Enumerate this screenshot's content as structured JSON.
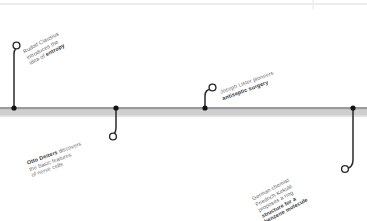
{
  "figure": {
    "kind": "horizontal-timeline",
    "orientation": "horizontal",
    "background_color": "#ffffff",
    "axis": {
      "bar_color": "#c9c9cb",
      "bar_top_edge_color": "#8e8e92",
      "bar_bottom_edge_color": "#e2e2e4",
      "marker_color": "#1c1c1e",
      "connector_color": "#2a2a2c"
    },
    "top_rule_color": "#e6e6e8"
  },
  "events": [
    {
      "id": "clausius",
      "position": "above",
      "marker_x": 14,
      "label_lines": [
        {
          "text": "Rudolf Clausius",
          "bold": false
        },
        {
          "text": "introduces the",
          "bold": false
        },
        {
          "text": "idea of ",
          "bold": false,
          "bold_tail": "entropy"
        }
      ],
      "plain_text": "Rudolf Clausius introduces the idea of entropy",
      "highlight_term": "entropy"
    },
    {
      "id": "deiters",
      "position": "below",
      "marker_x": 116,
      "label_lines": [
        {
          "text": " discovers",
          "bold": false,
          "bold_head": "Otto Deiters"
        },
        {
          "text": "the basic features",
          "bold": false
        },
        {
          "text": "of nerve cells",
          "bold": false
        }
      ],
      "plain_text": "Otto Deiters discovers the basic features of nerve cells",
      "highlight_term": "Otto Deiters"
    },
    {
      "id": "lister",
      "position": "above",
      "marker_x": 205,
      "label_lines": [
        {
          "text": "Joseph Lister pioneers",
          "bold": false
        },
        {
          "text": "antiseptic surgery",
          "bold": true
        }
      ],
      "plain_text": "Joseph Lister pioneers antiseptic surgery",
      "highlight_term": "antiseptic surgery"
    },
    {
      "id": "kekule",
      "position": "below",
      "marker_x": 353,
      "label_lines": [
        {
          "text": "German chemist",
          "bold": false
        },
        {
          "text": "Friedrich Kekulé",
          "bold": false
        },
        {
          "text": "proposes a ring",
          "bold": false
        },
        {
          "text": "structure for a",
          "bold": true
        },
        {
          "text": "benzene molecule",
          "bold": true
        }
      ],
      "plain_text": "German chemist Friedrich Kekulé proposes a ring structure for a benzene molecule",
      "highlight_term": "structure for a benzene molecule"
    }
  ],
  "labels": {
    "clausius": {
      "l1": "Rudolf Clausius",
      "l2": "introduces the",
      "l3_pre": "idea of ",
      "l3_bold": "entropy"
    },
    "deiters": {
      "l1_bold": "Otto Deiters",
      "l1_post": " discovers",
      "l2": "the basic features",
      "l3": "of nerve cells"
    },
    "lister": {
      "l1": "Joseph Lister pioneers",
      "l2_bold": "antiseptic surgery"
    },
    "kekule": {
      "l1": "German chemist",
      "l2": "Friedrich Kekulé",
      "l3": "proposes a ring",
      "l4_bold": "structure for a",
      "l5_bold": "benzene molecule"
    }
  }
}
